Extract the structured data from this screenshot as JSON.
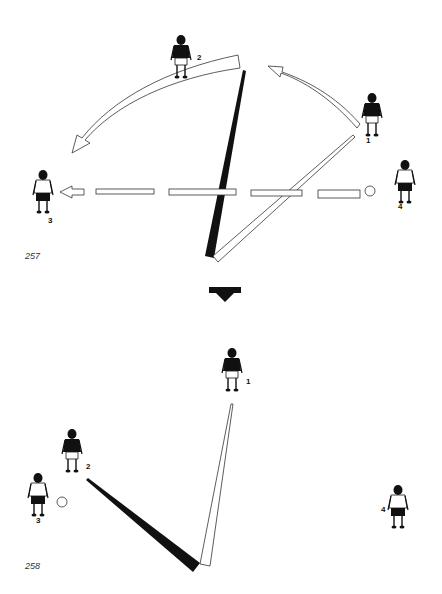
{
  "diagrams": [
    {
      "figure_number": "257",
      "players": [
        {
          "id": "2",
          "label": "2",
          "shirt": "dark"
        },
        {
          "id": "1",
          "label": "1",
          "shirt": "dark"
        },
        {
          "id": "3",
          "label": "3",
          "shirt": "light"
        },
        {
          "id": "4",
          "label": "4",
          "shirt": "light"
        }
      ],
      "movements": [
        {
          "type": "curved-run-arrow",
          "from": "2",
          "to": "3"
        },
        {
          "type": "curved-run-arrow",
          "from": "1",
          "to": "2-area"
        },
        {
          "type": "dashed-pass-arrow",
          "from": "ball",
          "to": "3"
        },
        {
          "type": "dark-wedge",
          "from": "bottom-vertex",
          "to": "2-area"
        },
        {
          "type": "light-wedge",
          "from": "bottom-vertex",
          "to": "1"
        }
      ]
    },
    {
      "figure_number": "258",
      "players": [
        {
          "id": "1",
          "label": "1",
          "shirt": "dark"
        },
        {
          "id": "2",
          "label": "2",
          "shirt": "dark"
        },
        {
          "id": "3",
          "label": "3",
          "shirt": "light"
        },
        {
          "id": "4",
          "label": "4",
          "shirt": "light"
        }
      ],
      "movements": [
        {
          "type": "dark-wedge",
          "from": "bottom-vertex",
          "to": "2"
        },
        {
          "type": "light-wedge",
          "from": "bottom-vertex",
          "to": "1"
        }
      ]
    }
  ],
  "transition_arrow": "down-arrow",
  "colors": {
    "ink": "#111111",
    "paper": "#ffffff",
    "outline": "#444444"
  }
}
